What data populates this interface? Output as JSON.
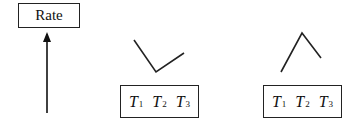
{
  "rate_box": {
    "label": "Rate"
  },
  "axis_arrow": {
    "direction": "up"
  },
  "panels": [
    {
      "shape": "V (valley: decrease then increase)",
      "temperatures": [
        {
          "letter": "T",
          "sub": "1"
        },
        {
          "letter": "T",
          "sub": "2"
        },
        {
          "letter": "T",
          "sub": "3"
        }
      ]
    },
    {
      "shape": "inverted V (peak: increase then decrease)",
      "temperatures": [
        {
          "letter": "T",
          "sub": "1"
        },
        {
          "letter": "T",
          "sub": "2"
        },
        {
          "letter": "T",
          "sub": "3"
        }
      ]
    }
  ],
  "colors": {
    "stroke": "#222222",
    "background": "#ffffff"
  }
}
